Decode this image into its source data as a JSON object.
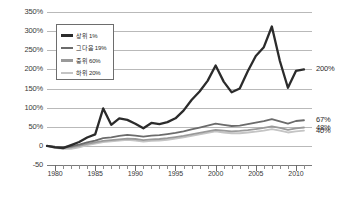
{
  "chart_data": {
    "type": "line",
    "title": "",
    "xlabel": "",
    "ylabel": "",
    "xlim": [
      1979,
      2012
    ],
    "ylim": [
      -50,
      350
    ],
    "grid": true,
    "legend_position": "inside-upper-left",
    "ytick_labels": [
      "350%",
      "300%",
      "250%",
      "200%",
      "150%",
      "100%",
      "50%",
      "0",
      "-50"
    ],
    "ytick_values": [
      350,
      300,
      250,
      200,
      150,
      100,
      50,
      0,
      -50
    ],
    "xtick_labels": [
      "1980",
      "1985",
      "1990",
      "1995",
      "2000",
      "2005",
      "2010"
    ],
    "xtick_values": [
      1980,
      1985,
      1990,
      1995,
      2000,
      2005,
      2010
    ],
    "x": [
      1979,
      1980,
      1981,
      1982,
      1983,
      1984,
      1985,
      1986,
      1987,
      1988,
      1989,
      1990,
      1991,
      1992,
      1993,
      1994,
      1995,
      1996,
      1997,
      1998,
      1999,
      2000,
      2001,
      2002,
      2003,
      2004,
      2005,
      2006,
      2007,
      2008,
      2009,
      2010,
      2011
    ],
    "series": [
      {
        "name": "상위 1%",
        "color": "#2b2b2b",
        "width": 2.3,
        "end_label": "200%",
        "values": [
          0,
          -4,
          -6,
          2,
          10,
          22,
          30,
          98,
          55,
          72,
          68,
          58,
          46,
          60,
          57,
          62,
          72,
          92,
          120,
          142,
          170,
          210,
          168,
          140,
          150,
          195,
          235,
          258,
          312,
          222,
          152,
          196,
          200
        ]
      },
      {
        "name": "그다음 19%",
        "color": "#6b6b6b",
        "width": 1.8,
        "end_label": "67%",
        "values": [
          0,
          -2,
          -3,
          -1,
          3,
          9,
          14,
          20,
          22,
          26,
          29,
          27,
          24,
          27,
          28,
          31,
          34,
          38,
          43,
          48,
          53,
          58,
          55,
          52,
          53,
          57,
          61,
          65,
          70,
          64,
          58,
          65,
          67
        ]
      },
      {
        "name": "중위 60%",
        "color": "#9a9a9a",
        "width": 1.8,
        "end_label": "48%",
        "values": [
          0,
          -3,
          -5,
          -4,
          0,
          5,
          9,
          13,
          15,
          17,
          19,
          18,
          15,
          17,
          18,
          20,
          23,
          26,
          30,
          34,
          38,
          42,
          40,
          38,
          39,
          41,
          44,
          47,
          51,
          47,
          42,
          46,
          48
        ]
      },
      {
        "name": "하위 20%",
        "color": "#c4c4c4",
        "width": 1.8,
        "end_label": "40%",
        "values": [
          0,
          -5,
          -8,
          -8,
          -4,
          2,
          6,
          10,
          12,
          14,
          16,
          14,
          11,
          13,
          14,
          16,
          19,
          22,
          26,
          30,
          34,
          38,
          35,
          33,
          33,
          35,
          37,
          40,
          44,
          40,
          35,
          38,
          40
        ]
      }
    ]
  }
}
